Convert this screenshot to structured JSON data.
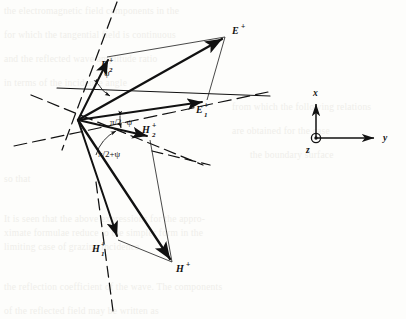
{
  "figure": {
    "type": "vector-diagram",
    "origin": {
      "x": 78,
      "y": 120
    }
  },
  "vectors": [
    {
      "name": "E-plus",
      "base": "E",
      "sup": "+",
      "sub": "",
      "label_x": 232,
      "label_y": 34,
      "tip_x": 225,
      "tip_y": 37,
      "weight": "heavy"
    },
    {
      "name": "E-one-plus",
      "base": "E",
      "sup": "+",
      "sub": "1",
      "label_x": 196,
      "label_y": 113,
      "tip_x": 205,
      "tip_y": 101,
      "weight": "heavy"
    },
    {
      "name": "E-two-plus",
      "base": "E",
      "sup": "+",
      "sub": "2",
      "label_x": 101,
      "label_y": 68,
      "tip_x": 107,
      "tip_y": 57,
      "weight": "heavy"
    },
    {
      "name": "H-plus",
      "base": "H",
      "sup": "+",
      "sub": "",
      "label_x": 176,
      "label_y": 272,
      "tip_x": 172,
      "tip_y": 262,
      "weight": "heavy"
    },
    {
      "name": "H-one-plus",
      "base": "H",
      "sup": "+",
      "sub": "1",
      "label_x": 92,
      "label_y": 252,
      "tip_x": 118,
      "tip_y": 240,
      "weight": "heavy"
    },
    {
      "name": "H-two-plus",
      "base": "H",
      "sup": "+",
      "sub": "2",
      "label_x": 142,
      "label_y": 133,
      "tip_x": 148,
      "tip_y": 138,
      "weight": "heavy"
    }
  ],
  "angles": [
    {
      "name": "psi",
      "text": "ψ",
      "x": 104,
      "y": 76
    },
    {
      "name": "half-pi-minus-psi",
      "text": "π/2−ψ",
      "x": 110,
      "y": 125
    },
    {
      "name": "half-pi-plus-psi",
      "text": "π/2+ψ",
      "x": 98,
      "y": 157
    }
  ],
  "axes": {
    "name": "coordinate-triad",
    "origin_x": 316,
    "origin_y": 138,
    "x_label": "x",
    "x_label_x": 313,
    "x_label_y": 96,
    "y_label": "y",
    "y_label_x": 383,
    "y_label_y": 141,
    "z_label": "z",
    "z_label_x": 306,
    "z_label_y": 153,
    "z_symbol": "circled-dot-out-of-page"
  },
  "colors": {
    "ink": "#111111",
    "paper": "#fdfdfb",
    "thin_line": "#2a2a2a",
    "ghost_text": "#efeeea"
  },
  "ghost_text_lines": [
    {
      "text": "the electromagnetic field components in the",
      "x": 4,
      "y": 6
    },
    {
      "text": "for which the tangential field is continuous",
      "x": 4,
      "y": 30
    },
    {
      "text": "and the reflected wave amplitude ratio",
      "x": 4,
      "y": 54
    },
    {
      "text": "in terms of the incidence angle",
      "x": 4,
      "y": 78
    },
    {
      "text": "from which the following relations",
      "x": 232,
      "y": 102
    },
    {
      "text": "are obtained for the case",
      "x": 232,
      "y": 126
    },
    {
      "text": "the boundary surface",
      "x": 250,
      "y": 150
    },
    {
      "text": "so that",
      "x": 4,
      "y": 174
    },
    {
      "text": "It is seen that the above expressions for the appro-",
      "x": 4,
      "y": 214
    },
    {
      "text": "ximate formulae reduce to the simpler form in the",
      "x": 4,
      "y": 228
    },
    {
      "text": "limiting case of grazing incidence",
      "x": 4,
      "y": 242
    },
    {
      "text": "the reflection coefficient of the wave. The components",
      "x": 4,
      "y": 282
    },
    {
      "text": "of the reflected field may be written as",
      "x": 4,
      "y": 306
    }
  ]
}
